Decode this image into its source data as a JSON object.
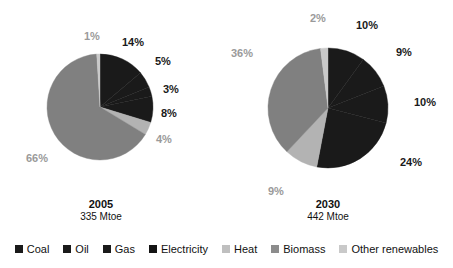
{
  "chart_data": {
    "type": "pie",
    "title": "",
    "unit": "%",
    "legend_position": "bottom",
    "categories": [
      "Coal",
      "Oil",
      "Gas",
      "Electricity",
      "Heat",
      "Biomass",
      "Other renewables"
    ],
    "colors": [
      "#1a1a1a",
      "#1a1a1a",
      "#1a1a1a",
      "#1a1a1a",
      "#b3b3b3",
      "#808080",
      "#c9c9c9"
    ],
    "charts": [
      {
        "name": "2005",
        "year_label": "2005",
        "total_label": "335 Mtoe",
        "total_value": 335,
        "total_unit": "Mtoe",
        "slices": [
          {
            "category": "Coal",
            "value": 14,
            "label": "14%",
            "tone": "dark",
            "color": "#1a1a1a"
          },
          {
            "category": "Oil",
            "value": 5,
            "label": "5%",
            "tone": "dark",
            "color": "#1a1a1a"
          },
          {
            "category": "Gas",
            "value": 3,
            "label": "3%",
            "tone": "dark",
            "color": "#1a1a1a"
          },
          {
            "category": "Electricity",
            "value": 8,
            "label": "8%",
            "tone": "dark",
            "color": "#1a1a1a"
          },
          {
            "category": "Heat",
            "value": 4,
            "label": "4%",
            "tone": "light",
            "color": "#b3b3b3"
          },
          {
            "category": "Biomass",
            "value": 66,
            "label": "66%",
            "tone": "light",
            "color": "#808080"
          },
          {
            "category": "Other renewables",
            "value": 1,
            "label": "1%",
            "tone": "light",
            "color": "#c9c9c9"
          }
        ]
      },
      {
        "name": "2030",
        "year_label": "2030",
        "total_label": "442 Mtoe",
        "total_value": 442,
        "total_unit": "Mtoe",
        "slices": [
          {
            "category": "Coal",
            "value": 10,
            "label": "10%",
            "tone": "dark",
            "color": "#1a1a1a"
          },
          {
            "category": "Oil",
            "value": 9,
            "label": "9%",
            "tone": "dark",
            "color": "#1a1a1a"
          },
          {
            "category": "Gas",
            "value": 10,
            "label": "10%",
            "tone": "dark",
            "color": "#1a1a1a"
          },
          {
            "category": "Electricity",
            "value": 24,
            "label": "24%",
            "tone": "dark",
            "color": "#1a1a1a"
          },
          {
            "category": "Heat",
            "value": 9,
            "label": "9%",
            "tone": "light",
            "color": "#b3b3b3"
          },
          {
            "category": "Biomass",
            "value": 36,
            "label": "36%",
            "tone": "light",
            "color": "#808080"
          },
          {
            "category": "Other renewables",
            "value": 2,
            "label": "2%",
            "tone": "light",
            "color": "#c9c9c9"
          }
        ]
      }
    ]
  },
  "legend": {
    "items": [
      {
        "label": "Coal",
        "color": "#1a1a1a"
      },
      {
        "label": "Oil",
        "color": "#1a1a1a"
      },
      {
        "label": "Gas",
        "color": "#1a1a1a"
      },
      {
        "label": "Electricity",
        "color": "#141414"
      },
      {
        "label": "Heat",
        "color": "#bfbfbf"
      },
      {
        "label": "Biomass",
        "color": "#8c8c8c"
      },
      {
        "label": "Other renewables",
        "color": "#c9c9c9"
      }
    ]
  },
  "labels": {
    "pie_2005": [
      {
        "text": "1%",
        "tone": "light",
        "x": 84,
        "y": 31
      },
      {
        "text": "14%",
        "tone": "dark",
        "x": 122,
        "y": 37
      },
      {
        "text": "5%",
        "tone": "dark",
        "x": 155,
        "y": 56
      },
      {
        "text": "3%",
        "tone": "dark",
        "x": 163,
        "y": 84
      },
      {
        "text": "8%",
        "tone": "dark",
        "x": 161,
        "y": 108
      },
      {
        "text": "4%",
        "tone": "light",
        "x": 156,
        "y": 134
      },
      {
        "text": "66%",
        "tone": "light",
        "x": 26,
        "y": 153
      }
    ],
    "pie_2030": [
      {
        "text": "2%",
        "tone": "light",
        "x": 310,
        "y": 13
      },
      {
        "text": "10%",
        "tone": "dark",
        "x": 356,
        "y": 20
      },
      {
        "text": "9%",
        "tone": "dark",
        "x": 396,
        "y": 47
      },
      {
        "text": "10%",
        "tone": "dark",
        "x": 414,
        "y": 97
      },
      {
        "text": "24%",
        "tone": "dark",
        "x": 400,
        "y": 157
      },
      {
        "text": "9%",
        "tone": "light",
        "x": 268,
        "y": 186
      },
      {
        "text": "36%",
        "tone": "light",
        "x": 231,
        "y": 48
      }
    ]
  },
  "captions": {
    "pie_2005": {
      "x": 66,
      "y": 198,
      "width": 70
    },
    "pie_2030": {
      "x": 293,
      "y": 198,
      "width": 70
    }
  },
  "geometry": {
    "pie_2005": {
      "cx": 100,
      "cy": 107,
      "r": 53
    },
    "pie_2030": {
      "cx": 328,
      "cy": 108,
      "r": 60
    }
  }
}
